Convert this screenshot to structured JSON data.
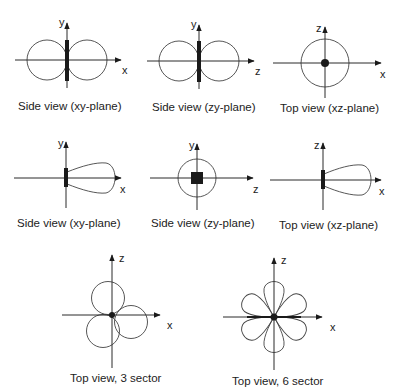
{
  "diagram": {
    "colors": {
      "line": "#444444",
      "axis": "#2a2a2a",
      "solid": "#1a1a1a",
      "text": "#222222",
      "background": "#ffffff"
    },
    "panels": [
      {
        "id": "p1",
        "caption": "Side view (xy-plane)",
        "horizontal_axis": "x",
        "vertical_axis": "y",
        "pattern": "figure-eight, vertical element"
      },
      {
        "id": "p2",
        "caption": "Side view (zy-plane)",
        "horizontal_axis": "z",
        "vertical_axis": "y",
        "pattern": "figure-eight, vertical element"
      },
      {
        "id": "p3",
        "caption": "Top view (xz-plane)",
        "horizontal_axis": "x",
        "vertical_axis": "z",
        "pattern": "omnidirectional circle, element end-on"
      },
      {
        "id": "p4",
        "caption": "Side view (xy-plane)",
        "horizontal_axis": "x",
        "vertical_axis": "y",
        "pattern": "directional lobe toward +x"
      },
      {
        "id": "p5",
        "caption": "Side view (zy-plane)",
        "horizontal_axis": "z",
        "vertical_axis": "y",
        "pattern": "small circle, square element"
      },
      {
        "id": "p6",
        "caption": "Top view (xz-plane)",
        "horizontal_axis": "x",
        "vertical_axis": "z",
        "pattern": "directional lobe toward +x"
      },
      {
        "id": "p7",
        "caption": "Top view, 3 sector",
        "horizontal_axis": "x",
        "vertical_axis": "z",
        "pattern": "three overlapping lobes"
      },
      {
        "id": "p8",
        "caption": "Top view, 6 sector",
        "horizontal_axis": "x",
        "vertical_axis": "z",
        "pattern": "six petal lobes"
      }
    ]
  }
}
